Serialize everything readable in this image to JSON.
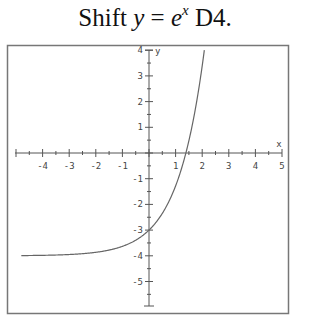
{
  "title": {
    "prefix": "Shift ",
    "y": "y",
    "eq": " = ",
    "base": "e",
    "exponent": "x",
    "suffix": " D4."
  },
  "colors": {
    "axis": "#555555",
    "curve": "#666666",
    "frame": "#777777",
    "text": "#444444"
  },
  "chart_data": {
    "type": "line",
    "function": "y = e^x - 4",
    "xlabel": "x",
    "ylabel": "y",
    "xlim": [
      -5,
      5
    ],
    "ylim": [
      -6,
      4
    ],
    "x_ticks": [
      -4,
      -3,
      -2,
      -1,
      1,
      2,
      3,
      4,
      5
    ],
    "y_ticks": [
      4,
      3,
      2,
      1,
      -1,
      -2,
      -3,
      -4,
      -5
    ],
    "grid": false,
    "legend": null,
    "asymptote": -4,
    "y_intercept": -3,
    "x_intercept": 1.386,
    "series": [
      {
        "name": "y = e^x - 4",
        "x": [
          -4.8,
          -4,
          -3,
          -2,
          -1,
          -0.5,
          0,
          0.5,
          1,
          1.386,
          1.5,
          1.75,
          2,
          2.08
        ],
        "values": [
          -3.99,
          -3.98,
          -3.95,
          -3.86,
          -3.63,
          -3.39,
          -3.0,
          -2.35,
          -1.28,
          0.0,
          0.48,
          1.75,
          3.39,
          4.0
        ]
      }
    ]
  }
}
